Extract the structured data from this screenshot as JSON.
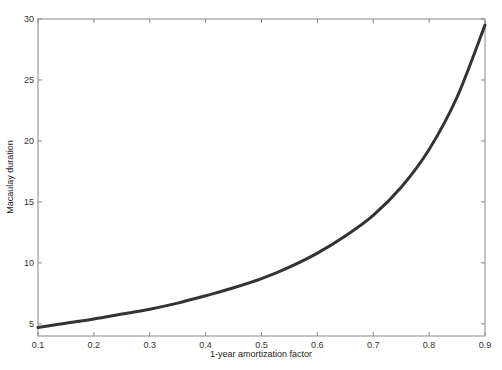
{
  "chart_data": {
    "type": "line",
    "title": "",
    "xlabel": "1-year amortization factor",
    "ylabel": "Macaulay duration",
    "xlim": [
      0.1,
      0.9
    ],
    "ylim": [
      4,
      30
    ],
    "xticks": [
      0.1,
      0.2,
      0.3,
      0.4,
      0.5,
      0.6,
      0.7,
      0.8,
      0.9
    ],
    "xtick_labels": [
      "0.1",
      "0.2",
      "0.3",
      "0.4",
      "0.5",
      "0.6",
      "0.7",
      "0.8",
      "0.9"
    ],
    "yticks": [
      5,
      10,
      15,
      20,
      25,
      30
    ],
    "ytick_labels": [
      "5",
      "10",
      "15",
      "20",
      "25",
      "30"
    ],
    "grid": false,
    "legend": null,
    "series": [
      {
        "name": "Macaulay duration",
        "color": "#333333",
        "x": [
          0.1,
          0.15,
          0.2,
          0.25,
          0.3,
          0.35,
          0.4,
          0.45,
          0.5,
          0.55,
          0.6,
          0.65,
          0.7,
          0.75,
          0.8,
          0.85,
          0.9
        ],
        "values": [
          4.7,
          5.05,
          5.4,
          5.8,
          6.2,
          6.7,
          7.3,
          7.95,
          8.7,
          9.65,
          10.8,
          12.2,
          13.9,
          16.2,
          19.3,
          23.6,
          29.5
        ]
      }
    ]
  }
}
